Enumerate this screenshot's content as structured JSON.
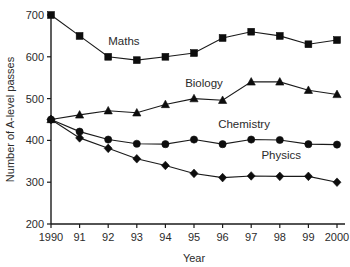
{
  "chart_data": {
    "type": "line",
    "title": "",
    "xlabel": "Year",
    "ylabel": "Number of A-level passes",
    "x": [
      1990,
      1991,
      1992,
      1993,
      1994,
      1995,
      1996,
      1997,
      1998,
      1999,
      2000
    ],
    "xtick_labels": [
      "1990",
      "91",
      "92",
      "93",
      "94",
      "95",
      "96",
      "97",
      "98",
      "99",
      "2000"
    ],
    "ytick_labels": [
      "200",
      "300",
      "400",
      "500",
      "600",
      "700"
    ],
    "yticks": [
      200,
      300,
      400,
      500,
      600,
      700
    ],
    "ylim": [
      200,
      700
    ],
    "grid": false,
    "legend_position": "inline-annotations",
    "series": [
      {
        "name": "Maths",
        "marker": "square",
        "values": [
          700,
          650,
          600,
          592,
          600,
          609,
          645,
          660,
          650,
          630,
          640
        ]
      },
      {
        "name": "Biology",
        "marker": "triangle",
        "values": [
          450,
          461,
          471,
          466,
          486,
          500,
          496,
          540,
          540,
          520,
          510
        ]
      },
      {
        "name": "Chemistry",
        "marker": "circle",
        "values": [
          450,
          421,
          402,
          392,
          391,
          402,
          391,
          402,
          401,
          391,
          390
        ]
      },
      {
        "name": "Physics",
        "marker": "diamond",
        "values": [
          450,
          406,
          381,
          356,
          340,
          321,
          311,
          315,
          314,
          314,
          300
        ]
      }
    ],
    "annotations": [
      {
        "text": "Maths",
        "x": 1992.55,
        "y": 629
      },
      {
        "text": "Biology",
        "x": 1995.35,
        "y": 528
      },
      {
        "text": "Chemistry",
        "x": 1996.75,
        "y": 430
      },
      {
        "text": "Physics",
        "x": 1998.05,
        "y": 355
      }
    ],
    "colors": {
      "ink": "#1a1a1a",
      "marker": "#0d0d0d",
      "background": "#ffffff"
    }
  }
}
